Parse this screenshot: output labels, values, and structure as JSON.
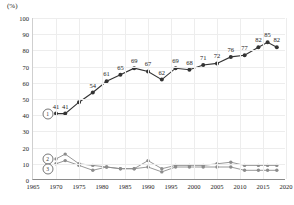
{
  "chart_data": {
    "type": "line",
    "title": "",
    "xlabel": "",
    "ylabel": "",
    "unit_label": "(%)",
    "xlim": [
      1965,
      2020
    ],
    "ylim": [
      0,
      100
    ],
    "grid": true,
    "legend_position": "inline-left",
    "yticks": [
      0,
      10,
      20,
      30,
      40,
      50,
      60,
      70,
      80,
      90,
      100
    ],
    "xticks": [
      1965,
      1970,
      1975,
      1980,
      1985,
      1990,
      1995,
      2000,
      2005,
      2010,
      2015,
      2020
    ],
    "series": [
      {
        "name": "1",
        "marker": "filled-circle",
        "color": "#333333",
        "labels_shown": true,
        "x": [
          1970,
          1972,
          1975,
          1978,
          1981,
          1984,
          1987,
          1990,
          1993,
          1996,
          1999,
          2002,
          2005,
          2008,
          2011,
          2014,
          2016,
          2018
        ],
        "values": [
          41,
          41,
          48,
          54,
          61,
          65,
          69,
          67,
          62,
          69,
          68,
          71,
          72,
          76,
          77,
          82,
          85,
          82
        ],
        "point_labels": [
          "41",
          "41",
          "",
          "54",
          "61",
          "65",
          "69",
          "67",
          "62",
          "69",
          "68",
          "71",
          "72",
          "76",
          "77",
          "82",
          "85",
          "82"
        ]
      },
      {
        "name": "2",
        "marker": "filled-circle",
        "color": "#8c8c8c",
        "labels_shown": false,
        "x": [
          1970,
          1972,
          1975,
          1978,
          1981,
          1984,
          1987,
          1990,
          1993,
          1996,
          1999,
          2002,
          2005,
          2008,
          2011,
          2014,
          2016,
          2018
        ],
        "values": [
          13,
          16,
          10,
          9,
          8,
          7,
          7,
          12,
          7,
          9,
          9,
          9,
          10,
          11,
          9,
          9,
          9,
          9
        ]
      },
      {
        "name": "3",
        "marker": "filled-circle",
        "color": "#8c8c8c",
        "labels_shown": false,
        "x": [
          1970,
          1972,
          1975,
          1978,
          1981,
          1984,
          1987,
          1990,
          1993,
          1996,
          1999,
          2002,
          2005,
          2008,
          2011,
          2014,
          2016,
          2018
        ],
        "values": [
          10,
          12,
          9,
          6,
          8,
          7,
          7,
          8,
          5,
          8,
          8,
          8,
          8,
          8,
          6,
          6,
          6,
          6
        ]
      }
    ],
    "series_tags": [
      {
        "label": "1",
        "x": 1968.2,
        "y": 41
      },
      {
        "label": "2",
        "x": 1968.2,
        "y": 13
      },
      {
        "label": "3",
        "x": 1968.2,
        "y": 7
      }
    ]
  }
}
